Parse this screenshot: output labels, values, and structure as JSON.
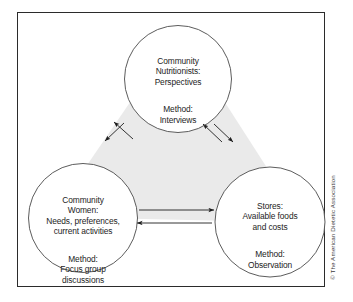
{
  "figure": {
    "type": "cycle-diagram",
    "frame": {
      "border_color": "#2b2b2b"
    },
    "center_fill_color": "#e9e9e9",
    "circle_stroke_color": "#4a4a4a",
    "arrow_color": "#1d1d1d",
    "nodes": [
      {
        "id": "community-nutritionists",
        "position": "top",
        "title": "Community\nNutritionists:\nPerspectives",
        "method": "Method:\nInterviews"
      },
      {
        "id": "community-women",
        "position": "left",
        "title": "Community\nWomen:\nNeeds, preferences,\ncurrent activities",
        "method": "Method:\nFocus group\ndiscussions"
      },
      {
        "id": "stores",
        "position": "right",
        "title": "Stores:\nAvailable foods\nand costs",
        "method": "Method:\nObservation"
      }
    ],
    "connections": [
      {
        "from": "community-nutritionists",
        "to": "community-women",
        "style": "bidirectional-pair"
      },
      {
        "from": "community-nutritionists",
        "to": "stores",
        "style": "bidirectional-pair"
      },
      {
        "from": "community-women",
        "to": "stores",
        "style": "bidirectional-pair"
      }
    ]
  },
  "credit": {
    "text": "© The American Dietetic Association"
  }
}
